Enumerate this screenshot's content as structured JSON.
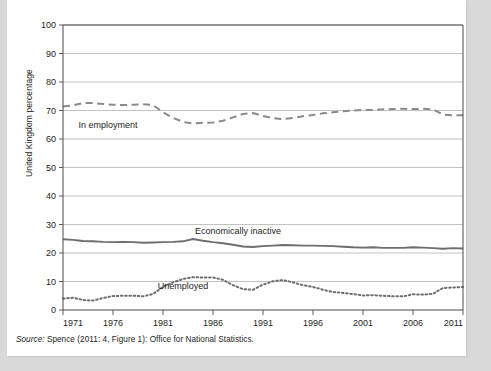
{
  "figure": {
    "ylabel": "United Kingdom percentage",
    "source_prefix": "Source:",
    "source_text": " Spence (2011: 4, Figure 1): Office for National Statistics."
  },
  "colors": {
    "employment": "#8a8a8a",
    "inactive": "#6e6e6e",
    "unemployed": "#6e6e6e",
    "grid": "#b4b4b4",
    "frame": "#4a4a4a",
    "text": "#1d1d1d",
    "page": "#ffffff",
    "backdrop": "#d9d9d9"
  },
  "chart_data": {
    "type": "line",
    "title": "",
    "xlabel": "",
    "ylabel": "United Kingdom percentage",
    "xlim": [
      1971,
      2011
    ],
    "ylim": [
      0,
      100
    ],
    "yticks": [
      0,
      10,
      20,
      30,
      40,
      50,
      60,
      70,
      80,
      90,
      100
    ],
    "xticks": [
      1971,
      1976,
      1981,
      1986,
      1991,
      1996,
      2001,
      2006,
      2011
    ],
    "xtick_labels": [
      "1971",
      "1976",
      "1981",
      "1986",
      "1991",
      "1996",
      "2001",
      "2006",
      "2011"
    ],
    "ytick_labels": [
      "0",
      "10",
      "20",
      "30",
      "40",
      "50",
      "60",
      "70",
      "80",
      "90",
      "100"
    ],
    "grid": true,
    "legend": "inline-annotations",
    "x": [
      1971,
      1972,
      1973,
      1974,
      1975,
      1976,
      1977,
      1978,
      1979,
      1980,
      1981,
      1982,
      1983,
      1984,
      1985,
      1986,
      1987,
      1988,
      1989,
      1990,
      1991,
      1992,
      1993,
      1994,
      1995,
      1996,
      1997,
      1998,
      1999,
      2000,
      2001,
      2002,
      2003,
      2004,
      2005,
      2006,
      2007,
      2008,
      2009,
      2010,
      2011
    ],
    "series": [
      {
        "name": "In employment",
        "style": "dashed",
        "label_x": 1975.5,
        "label_y": 64.0,
        "values": [
          71.4,
          71.8,
          72.6,
          72.6,
          72.3,
          72.0,
          71.9,
          72.0,
          72.2,
          71.9,
          69.4,
          67.4,
          66.0,
          65.4,
          65.7,
          65.8,
          66.4,
          67.6,
          68.8,
          69.1,
          68.1,
          67.3,
          67.0,
          67.4,
          68.0,
          68.4,
          69.0,
          69.4,
          69.7,
          70.0,
          70.2,
          70.2,
          70.4,
          70.5,
          70.6,
          70.5,
          70.6,
          70.4,
          68.6,
          68.3,
          68.3
        ]
      },
      {
        "name": "Economically inactive",
        "style": "solid",
        "label_x": 1988.5,
        "label_y": 26.5,
        "values": [
          24.8,
          24.6,
          24.2,
          24.1,
          23.9,
          23.8,
          23.9,
          23.8,
          23.6,
          23.7,
          23.8,
          23.9,
          24.1,
          24.9,
          24.3,
          23.8,
          23.4,
          22.9,
          22.3,
          22.1,
          22.4,
          22.6,
          22.8,
          22.7,
          22.6,
          22.6,
          22.5,
          22.4,
          22.2,
          22.0,
          21.9,
          22.0,
          21.8,
          21.8,
          21.8,
          22.0,
          21.9,
          21.7,
          21.5,
          21.7,
          21.6
        ]
      },
      {
        "name": "Unemployed",
        "style": "dotted",
        "label_x": 1983.0,
        "label_y": 7.4,
        "values": [
          4.0,
          4.3,
          3.5,
          3.3,
          4.2,
          4.9,
          5.0,
          5.0,
          4.8,
          5.6,
          8.1,
          9.7,
          10.9,
          11.5,
          11.4,
          11.4,
          10.6,
          8.7,
          7.3,
          7.1,
          8.9,
          10.1,
          10.5,
          9.7,
          8.7,
          8.1,
          7.1,
          6.3,
          6.0,
          5.6,
          5.1,
          5.2,
          5.0,
          4.8,
          4.8,
          5.5,
          5.4,
          5.7,
          7.7,
          7.9,
          8.1
        ]
      }
    ]
  }
}
